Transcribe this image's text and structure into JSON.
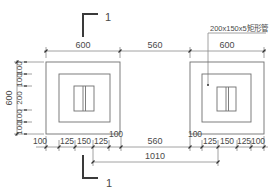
{
  "drawing": {
    "title": "Foundation plan with rectangular tube columns",
    "section_mark": {
      "label_top": "1",
      "label_bottom": "1"
    },
    "member_callout": "200x150x5矩形管",
    "colors": {
      "line": "#6f6f6f",
      "text": "#4a4a4a",
      "section": "#3a3a3a",
      "background": "#ffffff"
    }
  },
  "dimensions": {
    "top": [
      "600",
      "560",
      "600"
    ],
    "left_overall": "600",
    "left_sub": [
      "100",
      "100",
      "200",
      "100",
      "100"
    ],
    "bottom_left": [
      "100",
      "125",
      "150",
      "125",
      "100"
    ],
    "bottom_middle": "560",
    "bottom_right": [
      "100",
      "125",
      "150",
      "125",
      "100"
    ],
    "bottom_span": "1010"
  }
}
